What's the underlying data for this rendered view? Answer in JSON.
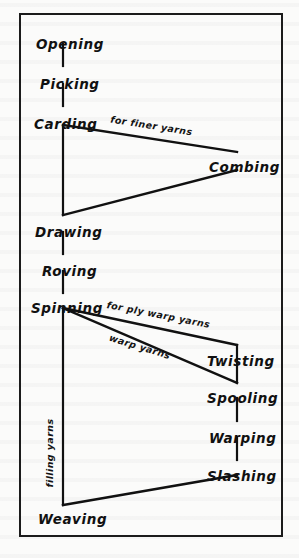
{
  "diagram": {
    "frame": {
      "stroke_color": "#1b1b1b"
    },
    "line_color": "#111111",
    "nodes": [
      {
        "id": "opening",
        "label": "Opening",
        "x": 36,
        "y": 38,
        "column": "left"
      },
      {
        "id": "picking",
        "label": "Picking",
        "x": 40,
        "y": 78,
        "column": "left"
      },
      {
        "id": "carding",
        "label": "Carding",
        "x": 34,
        "y": 118,
        "column": "left"
      },
      {
        "id": "combing",
        "label": "Combing",
        "x": 209,
        "y": 161,
        "column": "right"
      },
      {
        "id": "drawing",
        "label": "Drawing",
        "x": 35,
        "y": 226,
        "column": "left"
      },
      {
        "id": "roving",
        "label": "Roving",
        "x": 42,
        "y": 265,
        "column": "left"
      },
      {
        "id": "spinning",
        "label": "Spinning",
        "x": 31,
        "y": 302,
        "column": "left"
      },
      {
        "id": "twisting",
        "label": "Twisting",
        "x": 207,
        "y": 355,
        "column": "right"
      },
      {
        "id": "spooling",
        "label": "Spooling",
        "x": 207,
        "y": 392,
        "column": "right"
      },
      {
        "id": "warping",
        "label": "Warping",
        "x": 209,
        "y": 432,
        "column": "right"
      },
      {
        "id": "slashing",
        "label": "Slashing",
        "x": 207,
        "y": 470,
        "column": "right"
      },
      {
        "id": "weaving",
        "label": "Weaving",
        "x": 38,
        "y": 513,
        "column": "left"
      }
    ],
    "edge_labels": [
      {
        "id": "for-finer-yarns",
        "text": "for finer yarns",
        "x": 110,
        "y": 121,
        "rotate": 9,
        "orientation": "diagonal"
      },
      {
        "id": "for-ply-warp-yarns",
        "text": "for ply warp yarns",
        "x": 106,
        "y": 310,
        "rotate": 11,
        "orientation": "diagonal"
      },
      {
        "id": "warp-yarns",
        "text": "warp yarns",
        "x": 108,
        "y": 342,
        "rotate": 17,
        "orientation": "diagonal"
      },
      {
        "id": "filling-yarns",
        "text": "filling yarns",
        "x": 54,
        "y": 478,
        "rotate": -90,
        "orientation": "vertical"
      }
    ],
    "connectors": [
      {
        "id": "opening-picking",
        "from": "opening",
        "to": "picking",
        "type": "vertical",
        "x1": 63,
        "y1": 44,
        "x2": 63,
        "y2": 66
      },
      {
        "id": "picking-carding",
        "from": "picking",
        "to": "carding",
        "type": "vertical",
        "x1": 63,
        "y1": 84,
        "x2": 63,
        "y2": 106
      },
      {
        "id": "carding-combing",
        "from": "carding",
        "to": "combing",
        "type": "diagonal",
        "x1": 63,
        "y1": 125,
        "x2": 237,
        "y2": 152
      },
      {
        "id": "combing-drawing",
        "from": "combing",
        "to": "drawing",
        "type": "diagonal",
        "x1": 237,
        "y1": 170,
        "x2": 63,
        "y2": 215
      },
      {
        "id": "carding-drawing",
        "from": "carding",
        "to": "drawing",
        "type": "vertical",
        "x1": 63,
        "y1": 125,
        "x2": 63,
        "y2": 215
      },
      {
        "id": "drawing-roving",
        "from": "drawing",
        "to": "roving",
        "type": "vertical",
        "x1": 63,
        "y1": 232,
        "x2": 63,
        "y2": 254
      },
      {
        "id": "roving-spinning",
        "from": "roving",
        "to": "spinning",
        "type": "vertical",
        "x1": 63,
        "y1": 271,
        "x2": 63,
        "y2": 293
      },
      {
        "id": "spinning-twisting",
        "from": "spinning",
        "to": "twisting",
        "type": "diagonal",
        "x1": 63,
        "y1": 308,
        "x2": 237,
        "y2": 345
      },
      {
        "id": "spinning-spooling",
        "from": "spinning",
        "to": "spooling",
        "type": "diagonal",
        "x1": 63,
        "y1": 308,
        "x2": 237,
        "y2": 383
      },
      {
        "id": "twisting-spooling",
        "from": "twisting",
        "to": "spooling",
        "type": "vertical",
        "x1": 237,
        "y1": 345,
        "x2": 237,
        "y2": 383
      },
      {
        "id": "spooling-warping",
        "from": "spooling",
        "to": "warping",
        "type": "vertical",
        "x1": 237,
        "y1": 398,
        "x2": 237,
        "y2": 421
      },
      {
        "id": "warping-slashing",
        "from": "warping",
        "to": "slashing",
        "type": "vertical",
        "x1": 237,
        "y1": 438,
        "x2": 237,
        "y2": 460
      },
      {
        "id": "spinning-weaving",
        "from": "spinning",
        "to": "weaving",
        "type": "vertical",
        "x1": 63,
        "y1": 308,
        "x2": 63,
        "y2": 505
      },
      {
        "id": "slashing-weaving",
        "from": "slashing",
        "to": "weaving",
        "type": "diagonal",
        "x1": 237,
        "y1": 475,
        "x2": 63,
        "y2": 505
      }
    ]
  }
}
